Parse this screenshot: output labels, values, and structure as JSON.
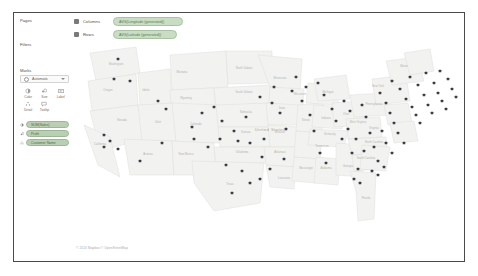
{
  "app": {
    "title": "Tableau Worksheet"
  },
  "shelves": {
    "columns": {
      "label": "Columns",
      "icon": "grid-icon",
      "pill": "AVG(Longitude (generated))"
    },
    "rows": {
      "label": "Rows",
      "icon": "grid-icon",
      "pill": "AVG(Latitude (generated))"
    }
  },
  "sidebar": {
    "pages_title": "Pages",
    "filters_title": "Filters",
    "marks_title": "Marks",
    "mark_type": {
      "label": "Automatic",
      "icon": "chevron-down-icon"
    },
    "mark_buttons": [
      {
        "name": "color",
        "label": "Color",
        "icon": "color-icon"
      },
      {
        "name": "size",
        "label": "Size",
        "icon": "size-icon"
      },
      {
        "name": "label",
        "label": "Label",
        "icon": "label-icon"
      },
      {
        "name": "detail",
        "label": "Detail",
        "icon": "detail-icon"
      },
      {
        "name": "tooltip",
        "label": "Tooltip",
        "icon": "tooltip-icon"
      }
    ],
    "mark_pills": [
      {
        "icon": "color-icon",
        "label": "SUM(Sales)"
      },
      {
        "icon": "size-icon",
        "label": "Profit"
      },
      {
        "icon": "detail-icon",
        "label": "Customer Name"
      }
    ]
  },
  "map": {
    "country_label": "United States",
    "attribution": "© 2024 Mapbox © OpenStreetMap",
    "state_labels": [
      {
        "name": "Washington",
        "x": 42,
        "y": 22
      },
      {
        "name": "Montana",
        "x": 108,
        "y": 30
      },
      {
        "name": "North Dakota",
        "x": 170,
        "y": 26
      },
      {
        "name": "Minnesota",
        "x": 206,
        "y": 36
      },
      {
        "name": "Oregon",
        "x": 34,
        "y": 48
      },
      {
        "name": "Idaho",
        "x": 72,
        "y": 48
      },
      {
        "name": "Wyoming",
        "x": 112,
        "y": 56
      },
      {
        "name": "South Dakota",
        "x": 170,
        "y": 50
      },
      {
        "name": "Wisconsin",
        "x": 226,
        "y": 52
      },
      {
        "name": "Michigan",
        "x": 254,
        "y": 50
      },
      {
        "name": "Nevada",
        "x": 48,
        "y": 78
      },
      {
        "name": "Utah",
        "x": 84,
        "y": 80
      },
      {
        "name": "Colorado",
        "x": 122,
        "y": 82
      },
      {
        "name": "Nebraska",
        "x": 172,
        "y": 70
      },
      {
        "name": "Iowa",
        "x": 208,
        "y": 66
      },
      {
        "name": "Illinois",
        "x": 232,
        "y": 78
      },
      {
        "name": "Indiana",
        "x": 252,
        "y": 76
      },
      {
        "name": "Ohio",
        "x": 272,
        "y": 72
      },
      {
        "name": "Pennsylvania",
        "x": 300,
        "y": 62
      },
      {
        "name": "New York",
        "x": 304,
        "y": 44
      },
      {
        "name": "California",
        "x": 26,
        "y": 102
      },
      {
        "name": "Arizona",
        "x": 74,
        "y": 112
      },
      {
        "name": "New Mexico",
        "x": 112,
        "y": 112
      },
      {
        "name": "Kansas",
        "x": 172,
        "y": 90
      },
      {
        "name": "Missouri",
        "x": 206,
        "y": 90
      },
      {
        "name": "Kentucky",
        "x": 256,
        "y": 92
      },
      {
        "name": "West Virginia",
        "x": 284,
        "y": 80
      },
      {
        "name": "Virginia",
        "x": 300,
        "y": 86
      },
      {
        "name": "Oklahoma",
        "x": 168,
        "y": 110
      },
      {
        "name": "Arkansas",
        "x": 206,
        "y": 110
      },
      {
        "name": "Tennessee",
        "x": 248,
        "y": 104
      },
      {
        "name": "North Carolina",
        "x": 300,
        "y": 100
      },
      {
        "name": "South Carolina",
        "x": 292,
        "y": 116
      },
      {
        "name": "Texas",
        "x": 156,
        "y": 142
      },
      {
        "name": "Louisiana",
        "x": 210,
        "y": 136
      },
      {
        "name": "Mississippi",
        "x": 232,
        "y": 126
      },
      {
        "name": "Alabama",
        "x": 252,
        "y": 126
      },
      {
        "name": "Georgia",
        "x": 274,
        "y": 124
      },
      {
        "name": "Florida",
        "x": 292,
        "y": 156
      },
      {
        "name": "Maine",
        "x": 330,
        "y": 24
      }
    ],
    "marks": [
      [
        44,
        16
      ],
      [
        40,
        36
      ],
      [
        56,
        38
      ],
      [
        30,
        92
      ],
      [
        36,
        98
      ],
      [
        30,
        104
      ],
      [
        44,
        106
      ],
      [
        66,
        118
      ],
      [
        84,
        58
      ],
      [
        92,
        66
      ],
      [
        88,
        100
      ],
      [
        118,
        84
      ],
      [
        120,
        96
      ],
      [
        128,
        70
      ],
      [
        152,
        122
      ],
      [
        168,
        128
      ],
      [
        176,
        140
      ],
      [
        158,
        150
      ],
      [
        186,
        136
      ],
      [
        172,
        74
      ],
      [
        190,
        96
      ],
      [
        198,
        60
      ],
      [
        206,
        70
      ],
      [
        212,
        86
      ],
      [
        210,
        116
      ],
      [
        222,
        34
      ],
      [
        228,
        58
      ],
      [
        236,
        72
      ],
      [
        240,
        88
      ],
      [
        246,
        110
      ],
      [
        252,
        120
      ],
      [
        258,
        66
      ],
      [
        262,
        78
      ],
      [
        268,
        96
      ],
      [
        274,
        86
      ],
      [
        278,
        110
      ],
      [
        284,
        126
      ],
      [
        288,
        62
      ],
      [
        292,
        74
      ],
      [
        296,
        90
      ],
      [
        300,
        104
      ],
      [
        304,
        118
      ],
      [
        286,
        140
      ],
      [
        306,
        50
      ],
      [
        312,
        60
      ],
      [
        316,
        70
      ],
      [
        320,
        80
      ],
      [
        324,
        90
      ],
      [
        330,
        100
      ],
      [
        318,
        38
      ],
      [
        326,
        46
      ],
      [
        332,
        56
      ],
      [
        338,
        64
      ],
      [
        342,
        72
      ],
      [
        346,
        80
      ],
      [
        336,
        34
      ],
      [
        344,
        42
      ],
      [
        350,
        52
      ],
      [
        354,
        62
      ],
      [
        358,
        70
      ],
      [
        352,
        30
      ],
      [
        360,
        40
      ],
      [
        364,
        50
      ],
      [
        368,
        58
      ],
      [
        372,
        66
      ],
      [
        366,
        28
      ],
      [
        374,
        36
      ],
      [
        378,
        46
      ],
      [
        382,
        54
      ],
      [
        244,
        40
      ],
      [
        250,
        52
      ],
      [
        232,
        44
      ],
      [
        218,
        48
      ],
      [
        200,
        44
      ],
      [
        186,
        54
      ],
      [
        140,
        64
      ],
      [
        148,
        78
      ],
      [
        134,
        104
      ],
      [
        146,
        96
      ],
      [
        160,
        88
      ],
      [
        196,
        126
      ],
      [
        188,
        114
      ],
      [
        176,
        100
      ],
      [
        164,
        98
      ],
      [
        270,
        58
      ],
      [
        276,
        68
      ],
      [
        282,
        96
      ],
      [
        290,
        108
      ],
      [
        298,
        128
      ],
      [
        280,
        136
      ],
      [
        308,
        88
      ],
      [
        312,
        100
      ],
      [
        318,
        110
      ],
      [
        304,
        132
      ],
      [
        310,
        124
      ]
    ]
  }
}
